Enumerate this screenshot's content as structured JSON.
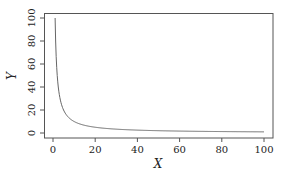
{
  "chart_data": {
    "type": "line",
    "title": "",
    "xlabel": "X",
    "ylabel": "Y",
    "xlim": [
      -4,
      104
    ],
    "ylim": [
      -4,
      104
    ],
    "x_ticks": [
      0,
      20,
      40,
      60,
      80,
      100
    ],
    "y_ticks": [
      0,
      20,
      40,
      60,
      80,
      100
    ],
    "grid": false,
    "legend": null,
    "series": [
      {
        "name": "y = 100/x",
        "color": "#666666",
        "x": [
          1,
          2,
          3,
          4,
          5,
          6,
          8,
          10,
          12,
          15,
          20,
          25,
          30,
          40,
          50,
          60,
          70,
          80,
          90,
          100
        ],
        "y": [
          100,
          50,
          33.3,
          25,
          20,
          16.7,
          12.5,
          10,
          8.3,
          6.7,
          5,
          4,
          3.3,
          2.5,
          2,
          1.7,
          1.4,
          1.25,
          1.1,
          1
        ]
      }
    ]
  }
}
